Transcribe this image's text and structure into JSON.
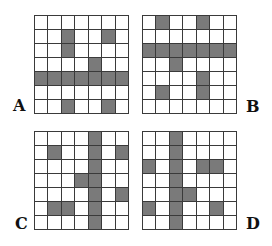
{
  "options": [
    {
      "id": "a",
      "label": "A",
      "rows": 7,
      "cols": 7,
      "filled": [
        [
          1,
          2
        ],
        [
          1,
          5
        ],
        [
          2,
          2
        ],
        [
          3,
          4
        ],
        [
          4,
          0
        ],
        [
          4,
          1
        ],
        [
          4,
          2
        ],
        [
          4,
          3
        ],
        [
          4,
          4
        ],
        [
          4,
          5
        ],
        [
          4,
          6
        ],
        [
          6,
          2
        ],
        [
          6,
          5
        ]
      ]
    },
    {
      "id": "b",
      "label": "B",
      "rows": 7,
      "cols": 7,
      "filled": [
        [
          0,
          1
        ],
        [
          0,
          4
        ],
        [
          2,
          0
        ],
        [
          2,
          1
        ],
        [
          2,
          2
        ],
        [
          2,
          3
        ],
        [
          2,
          4
        ],
        [
          2,
          5
        ],
        [
          2,
          6
        ],
        [
          3,
          2
        ],
        [
          4,
          4
        ],
        [
          5,
          1
        ],
        [
          5,
          4
        ]
      ]
    },
    {
      "id": "c",
      "label": "C",
      "rows": 7,
      "cols": 7,
      "filled": [
        [
          0,
          4
        ],
        [
          1,
          4
        ],
        [
          2,
          4
        ],
        [
          3,
          4
        ],
        [
          4,
          4
        ],
        [
          5,
          4
        ],
        [
          6,
          4
        ],
        [
          1,
          1
        ],
        [
          1,
          6
        ],
        [
          3,
          3
        ],
        [
          4,
          6
        ],
        [
          5,
          1
        ],
        [
          5,
          2
        ]
      ]
    },
    {
      "id": "d",
      "label": "D",
      "rows": 7,
      "cols": 7,
      "filled": [
        [
          0,
          2
        ],
        [
          1,
          2
        ],
        [
          2,
          2
        ],
        [
          3,
          2
        ],
        [
          4,
          2
        ],
        [
          5,
          2
        ],
        [
          6,
          2
        ],
        [
          2,
          0
        ],
        [
          2,
          4
        ],
        [
          2,
          5
        ],
        [
          4,
          3
        ],
        [
          5,
          0
        ],
        [
          5,
          5
        ]
      ]
    }
  ],
  "colors": {
    "filled": "#7a7a7a",
    "empty": "#ffffff",
    "grid_line": "#3a3a3a"
  }
}
